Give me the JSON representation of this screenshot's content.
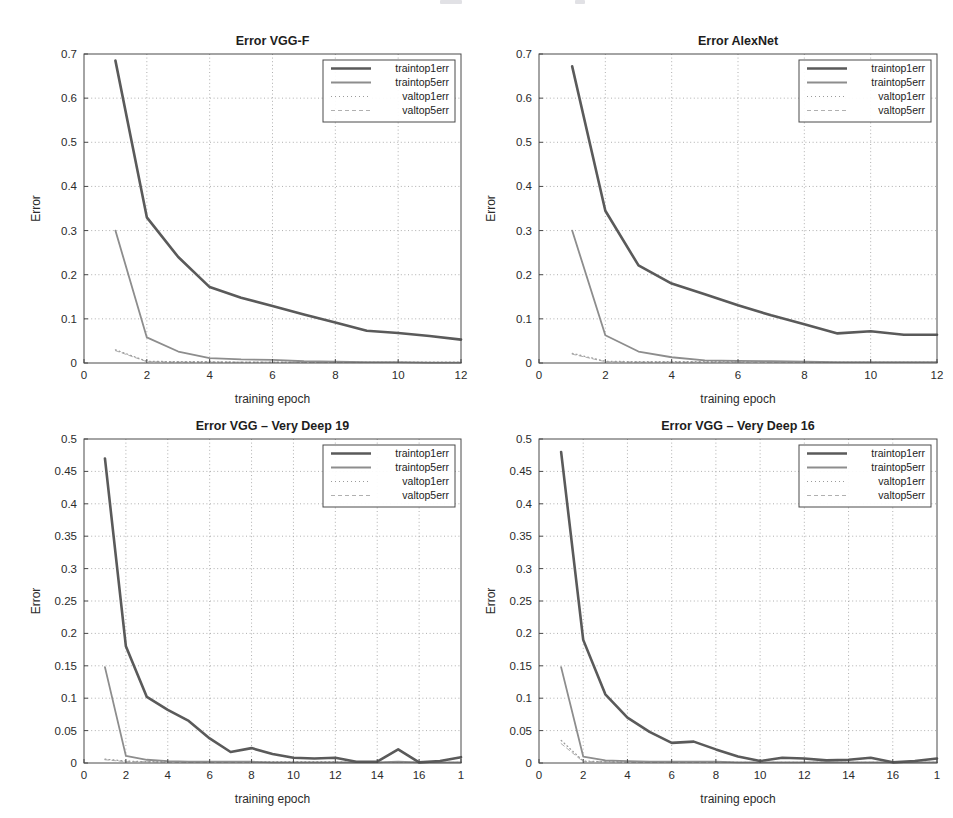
{
  "figure": {
    "width": 953,
    "height": 818,
    "background": "#ffffff",
    "series_styles": [
      {
        "key": "traintop1err",
        "label": "traintop1err",
        "color": "#5a5a5a",
        "width": 2.6,
        "dash": "none"
      },
      {
        "key": "traintop5err",
        "label": "traintop5err",
        "color": "#8d8d8d",
        "width": 1.8,
        "dash": "none"
      },
      {
        "key": "valtop1err",
        "label": "valtop1err",
        "color": "#9b9b9b",
        "width": 1.2,
        "dash": "1 3"
      },
      {
        "key": "valtop5err",
        "label": "valtop5err",
        "color": "#b0b0b0",
        "width": 1.0,
        "dash": "4 3"
      }
    ]
  },
  "chart_data": [
    {
      "id": "vgg-f",
      "type": "line",
      "title": "Error VGG-F",
      "xlabel": "training epoch",
      "ylabel": "Error",
      "xlim": [
        0,
        12
      ],
      "ylim": [
        0,
        0.7
      ],
      "xticks": [
        0,
        2,
        4,
        6,
        8,
        10,
        12
      ],
      "xticklabels": [
        "0",
        "2",
        "4",
        "6",
        "8",
        "10",
        "12"
      ],
      "yticks": [
        0,
        0.1,
        0.2,
        0.3,
        0.4,
        0.5,
        0.6,
        0.7
      ],
      "yticklabels": [
        "0",
        "0.1",
        "0.2",
        "0.3",
        "0.4",
        "0.5",
        "0.6",
        "0.7"
      ],
      "grid": true,
      "legend_position": "top-right",
      "x": [
        1,
        2,
        3,
        4,
        5,
        6,
        7,
        8,
        9,
        10,
        11,
        12
      ],
      "series": [
        {
          "name": "traintop1err",
          "values": [
            0.685,
            0.33,
            0.24,
            0.172,
            0.148,
            0.129,
            0.11,
            0.092,
            0.073,
            0.068,
            0.061,
            0.053
          ]
        },
        {
          "name": "traintop5err",
          "values": [
            0.3,
            0.058,
            0.026,
            0.011,
            0.008,
            0.007,
            0.004,
            0.003,
            0.002,
            0.002,
            0.001,
            0.001
          ]
        },
        {
          "name": "valtop1err",
          "values": [
            0.03,
            0.004,
            0.003,
            0.003,
            0.002,
            0.002,
            0.002,
            0.002,
            0.002,
            0.002,
            0.002,
            0.002
          ]
        },
        {
          "name": "valtop5err",
          "values": [
            0.028,
            0.003,
            0.002,
            0.002,
            0.002,
            0.002,
            0.001,
            0.001,
            0.001,
            0.001,
            0.001,
            0.001
          ]
        }
      ]
    },
    {
      "id": "alexnet",
      "type": "line",
      "title": "Error AlexNet",
      "xlabel": "training epoch",
      "ylabel": "Error",
      "xlim": [
        0,
        12
      ],
      "ylim": [
        0,
        0.7
      ],
      "xticks": [
        0,
        2,
        4,
        6,
        8,
        10,
        12
      ],
      "xticklabels": [
        "0",
        "2",
        "4",
        "6",
        "8",
        "10",
        "12"
      ],
      "yticks": [
        0,
        0.1,
        0.2,
        0.3,
        0.4,
        0.5,
        0.6,
        0.7
      ],
      "yticklabels": [
        "0",
        "0.1",
        "0.2",
        "0.3",
        "0.4",
        "0.5",
        "0.6",
        "0.7"
      ],
      "grid": true,
      "legend_position": "top-right",
      "x": [
        1,
        2,
        3,
        4,
        5,
        6,
        7,
        8,
        9,
        10,
        11,
        12
      ],
      "series": [
        {
          "name": "traintop1err",
          "values": [
            0.672,
            0.345,
            0.221,
            0.18,
            0.156,
            0.131,
            0.108,
            0.088,
            0.067,
            0.072,
            0.064,
            0.064
          ]
        },
        {
          "name": "traintop5err",
          "values": [
            0.3,
            0.063,
            0.026,
            0.013,
            0.006,
            0.005,
            0.004,
            0.003,
            0.002,
            0.002,
            0.002,
            0.002
          ]
        },
        {
          "name": "valtop1err",
          "values": [
            0.022,
            0.004,
            0.003,
            0.003,
            0.003,
            0.003,
            0.003,
            0.003,
            0.002,
            0.002,
            0.002,
            0.002
          ]
        },
        {
          "name": "valtop5err",
          "values": [
            0.02,
            0.003,
            0.002,
            0.002,
            0.002,
            0.002,
            0.002,
            0.002,
            0.001,
            0.001,
            0.001,
            0.001
          ]
        }
      ]
    },
    {
      "id": "vgg-very-deep-19",
      "type": "line",
      "title": "Error VGG – Very Deep 19",
      "xlabel": "training epoch",
      "ylabel": "Error",
      "xlim": [
        0,
        18
      ],
      "ylim": [
        0,
        0.5
      ],
      "xticks": [
        0,
        2,
        4,
        6,
        8,
        10,
        12,
        14,
        16,
        18
      ],
      "xticklabels": [
        "0",
        "2",
        "4",
        "6",
        "8",
        "10",
        "12",
        "14",
        "16",
        "1"
      ],
      "yticks": [
        0,
        0.05,
        0.1,
        0.15,
        0.2,
        0.25,
        0.3,
        0.35,
        0.4,
        0.45,
        0.5
      ],
      "yticklabels": [
        "0",
        "0.05",
        "0.1",
        "0.15",
        "0.2",
        "0.25",
        "0.3",
        "0.35",
        "0.4",
        "0.45",
        "0.5"
      ],
      "grid": true,
      "legend_position": "top-right",
      "x": [
        1,
        2,
        3,
        4,
        5,
        6,
        7,
        8,
        9,
        10,
        11,
        12,
        13,
        14,
        15,
        16,
        17,
        18
      ],
      "series": [
        {
          "name": "traintop1err",
          "values": [
            0.47,
            0.18,
            0.102,
            0.082,
            0.065,
            0.038,
            0.017,
            0.023,
            0.014,
            0.008,
            0.007,
            0.008,
            0.002,
            0.002,
            0.021,
            0.001,
            0.003,
            0.009
          ]
        },
        {
          "name": "traintop5err",
          "values": [
            0.148,
            0.011,
            0.005,
            0.003,
            0.002,
            0.002,
            0.002,
            0.002,
            0.001,
            0.001,
            0.001,
            0.001,
            0.001,
            0.001,
            0.002,
            0.001,
            0.001,
            0.001
          ]
        },
        {
          "name": "valtop1err",
          "values": [
            0.006,
            0.003,
            0.002,
            0.002,
            0.002,
            0.002,
            0.002,
            0.002,
            0.002,
            0.002,
            0.002,
            0.002,
            0.001,
            0.001,
            0.001,
            0.001,
            0.001,
            0.001
          ]
        },
        {
          "name": "valtop5err",
          "values": [
            0.005,
            0.002,
            0.002,
            0.001,
            0.001,
            0.001,
            0.001,
            0.001,
            0.001,
            0.001,
            0.001,
            0.001,
            0.001,
            0.001,
            0.001,
            0.001,
            0.001,
            0.001
          ]
        }
      ]
    },
    {
      "id": "vgg-very-deep-16",
      "type": "line",
      "title": "Error VGG – Very Deep 16",
      "xlabel": "training epoch",
      "ylabel": "Error",
      "xlim": [
        0,
        18
      ],
      "ylim": [
        0,
        0.5
      ],
      "xticks": [
        0,
        2,
        4,
        6,
        8,
        10,
        12,
        14,
        16,
        18
      ],
      "xticklabels": [
        "0",
        "2",
        "4",
        "6",
        "8",
        "10",
        "12",
        "14",
        "16",
        "1"
      ],
      "yticks": [
        0,
        0.05,
        0.1,
        0.15,
        0.2,
        0.25,
        0.3,
        0.35,
        0.4,
        0.45,
        0.5
      ],
      "yticklabels": [
        "0",
        "0.05",
        "0.1",
        "0.15",
        "0.2",
        "0.25",
        "0.3",
        "0.35",
        "0.4",
        "0.45",
        "0.5"
      ],
      "grid": true,
      "legend_position": "top-right",
      "x": [
        1,
        2,
        3,
        4,
        5,
        6,
        7,
        8,
        9,
        10,
        11,
        12,
        13,
        14,
        15,
        16,
        17,
        18
      ],
      "series": [
        {
          "name": "traintop1err",
          "values": [
            0.48,
            0.19,
            0.106,
            0.07,
            0.048,
            0.031,
            0.033,
            0.021,
            0.01,
            0.003,
            0.008,
            0.007,
            0.004,
            0.005,
            0.008,
            0.001,
            0.003,
            0.007
          ]
        },
        {
          "name": "traintop5err",
          "values": [
            0.148,
            0.01,
            0.004,
            0.003,
            0.002,
            0.002,
            0.002,
            0.002,
            0.001,
            0.001,
            0.001,
            0.001,
            0.001,
            0.001,
            0.001,
            0.001,
            0.001,
            0.001
          ]
        },
        {
          "name": "valtop1err",
          "values": [
            0.035,
            0.003,
            0.002,
            0.002,
            0.002,
            0.002,
            0.002,
            0.002,
            0.001,
            0.001,
            0.001,
            0.001,
            0.001,
            0.001,
            0.001,
            0.001,
            0.001,
            0.001
          ]
        },
        {
          "name": "valtop5err",
          "values": [
            0.03,
            0.002,
            0.002,
            0.001,
            0.001,
            0.001,
            0.001,
            0.001,
            0.001,
            0.001,
            0.001,
            0.001,
            0.001,
            0.001,
            0.001,
            0.001,
            0.001,
            0.001
          ]
        }
      ]
    }
  ],
  "panels": [
    {
      "id": "vgg-f",
      "left": 22,
      "top": 30,
      "width": 455,
      "height": 385
    },
    {
      "id": "alexnet",
      "left": 477,
      "top": 30,
      "width": 476,
      "height": 385
    },
    {
      "id": "vgg-very-deep-19",
      "left": 22,
      "top": 415,
      "width": 455,
      "height": 400
    },
    {
      "id": "vgg-very-deep-16",
      "left": 477,
      "top": 415,
      "width": 476,
      "height": 400
    }
  ]
}
